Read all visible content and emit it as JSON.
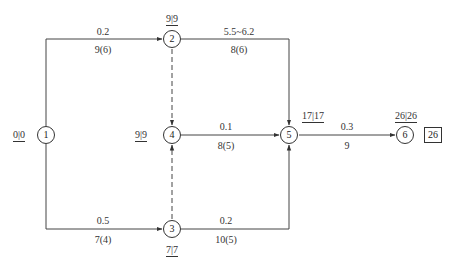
{
  "diagram": {
    "type": "network-plan",
    "nodes": [
      {
        "id": "1",
        "label": "1",
        "times": "0|0",
        "time_left": "0",
        "time_right": "0"
      },
      {
        "id": "2",
        "label": "2",
        "times": "9|9",
        "time_left": "9",
        "time_right": "9"
      },
      {
        "id": "3",
        "label": "3",
        "times": "7|7",
        "time_left": "7",
        "time_right": "7"
      },
      {
        "id": "4",
        "label": "4",
        "times": "9|9",
        "time_left": "9",
        "time_right": "9"
      },
      {
        "id": "5",
        "label": "5",
        "times": "17|17",
        "time_left": "17",
        "time_right": "17"
      },
      {
        "id": "6",
        "label": "6",
        "times": "26|26",
        "time_left": "26",
        "time_right": "26"
      }
    ],
    "edges": [
      {
        "from": "1",
        "to": "2",
        "top": "0.2",
        "bottom": "9(6)",
        "style": "solid"
      },
      {
        "from": "1",
        "to": "3",
        "top": "0.5",
        "bottom": "7(4)",
        "style": "solid"
      },
      {
        "from": "2",
        "to": "5",
        "top": "5.5~6.2",
        "bottom": "8(6)",
        "style": "solid"
      },
      {
        "from": "2",
        "to": "4",
        "top": "",
        "bottom": "",
        "style": "dashed"
      },
      {
        "from": "3",
        "to": "4",
        "top": "",
        "bottom": "",
        "style": "dashed"
      },
      {
        "from": "4",
        "to": "5",
        "top": "0.1",
        "bottom": "8(5)",
        "style": "solid"
      },
      {
        "from": "3",
        "to": "5",
        "top": "0.2",
        "bottom": "10(5)",
        "style": "solid"
      },
      {
        "from": "5",
        "to": "6",
        "top": "0.3",
        "bottom": "9",
        "style": "solid"
      }
    ],
    "total_duration": "26"
  }
}
